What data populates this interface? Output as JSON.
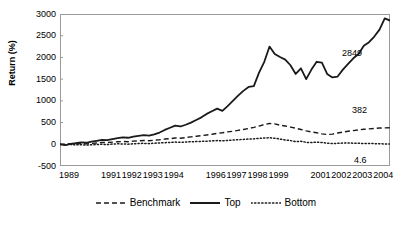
{
  "chart_data": {
    "type": "line",
    "title": "",
    "xlabel": "",
    "ylabel": "Return (%)",
    "ylim": [
      -500,
      3000
    ],
    "ytick_labels": [
      "3000",
      "2500",
      "2000",
      "1500",
      "1000",
      "500",
      "0",
      "-500"
    ],
    "yticks": [
      3000,
      2500,
      2000,
      1500,
      1000,
      500,
      0,
      -500
    ],
    "grid": false,
    "legend_position": "bottom-center",
    "xlim": [
      1989,
      2004.75
    ],
    "xtick_labels": [
      "1989",
      "1991",
      "1992",
      "1993",
      "1994",
      "1996",
      "1997",
      "1998",
      "1999",
      "2001",
      "2002",
      "2003",
      "2004"
    ],
    "xticks": [
      1989,
      1991,
      1992,
      1993,
      1994,
      1996,
      1997,
      1998,
      1999,
      2001,
      2002,
      2003,
      2004
    ],
    "x": [
      1989.0,
      1989.25,
      1989.5,
      1989.75,
      1990.0,
      1990.25,
      1990.5,
      1990.75,
      1991.0,
      1991.25,
      1991.5,
      1991.75,
      1992.0,
      1992.25,
      1992.5,
      1992.75,
      1993.0,
      1993.25,
      1993.5,
      1993.75,
      1994.0,
      1994.25,
      1994.5,
      1994.75,
      1995.0,
      1995.25,
      1995.5,
      1995.75,
      1996.0,
      1996.25,
      1996.5,
      1996.75,
      1997.0,
      1997.25,
      1997.5,
      1997.75,
      1998.0,
      1998.25,
      1998.5,
      1998.75,
      1999.0,
      1999.25,
      1999.5,
      1999.75,
      2000.0,
      2000.25,
      2000.5,
      2000.75,
      2001.0,
      2001.25,
      2001.5,
      2001.75,
      2002.0,
      2002.25,
      2002.5,
      2002.75,
      2003.0,
      2003.25,
      2003.5,
      2003.75,
      2004.0,
      2004.25,
      2004.5,
      2004.75
    ],
    "series": [
      {
        "name": "Benchmark",
        "style": "dashed",
        "end_value": 382,
        "end_label": "382",
        "values": [
          0,
          5,
          12,
          8,
          15,
          10,
          20,
          30,
          42,
          38,
          50,
          58,
          65,
          60,
          72,
          80,
          88,
          82,
          95,
          105,
          120,
          130,
          145,
          140,
          155,
          170,
          185,
          200,
          215,
          230,
          250,
          265,
          285,
          300,
          320,
          340,
          365,
          390,
          420,
          455,
          480,
          470,
          440,
          420,
          395,
          370,
          340,
          310,
          285,
          265,
          240,
          225,
          235,
          260,
          280,
          300,
          315,
          330,
          345,
          355,
          365,
          375,
          378,
          382
        ]
      },
      {
        "name": "Top",
        "style": "solid",
        "end_value": 2849,
        "end_label": "2849",
        "values": [
          0,
          -20,
          10,
          25,
          45,
          35,
          60,
          80,
          100,
          95,
          120,
          140,
          160,
          150,
          175,
          195,
          210,
          200,
          230,
          270,
          330,
          380,
          430,
          410,
          450,
          500,
          560,
          620,
          700,
          760,
          820,
          770,
          880,
          1000,
          1120,
          1230,
          1320,
          1340,
          1650,
          1900,
          2250,
          2080,
          2010,
          1950,
          1820,
          1620,
          1750,
          1500,
          1720,
          1900,
          1880,
          1620,
          1540,
          1560,
          1720,
          1850,
          1980,
          2080,
          2270,
          2350,
          2480,
          2640,
          2900,
          2849
        ]
      },
      {
        "name": "Bottom",
        "style": "dotted",
        "end_value": 4.6,
        "end_label": "4.6",
        "values": [
          0,
          -10,
          -5,
          -15,
          -8,
          -20,
          -12,
          -5,
          0,
          -8,
          5,
          10,
          8,
          2,
          12,
          18,
          22,
          15,
          25,
          30,
          38,
          42,
          50,
          45,
          52,
          58,
          62,
          68,
          72,
          78,
          85,
          80,
          90,
          98,
          105,
          112,
          120,
          125,
          138,
          145,
          150,
          140,
          120,
          100,
          85,
          60,
          70,
          45,
          40,
          50,
          42,
          25,
          18,
          22,
          28,
          30,
          25,
          22,
          20,
          18,
          15,
          12,
          8,
          4.6
        ]
      }
    ]
  },
  "axis": {
    "y_title": "Return (%)"
  },
  "legend": {
    "items": [
      {
        "label": "Benchmark",
        "style": "dashed"
      },
      {
        "label": "Top",
        "style": "solid"
      },
      {
        "label": "Bottom",
        "style": "dotted"
      }
    ]
  },
  "annotations": [
    {
      "name": "top-end-value",
      "text": "2849"
    },
    {
      "name": "benchmark-end-value",
      "text": "382"
    },
    {
      "name": "bottom-end-value",
      "text": "4.6"
    }
  ],
  "colors": {
    "line": "#1a1a1a",
    "frame": "#9a9a9a",
    "background": "#ffffff"
  }
}
